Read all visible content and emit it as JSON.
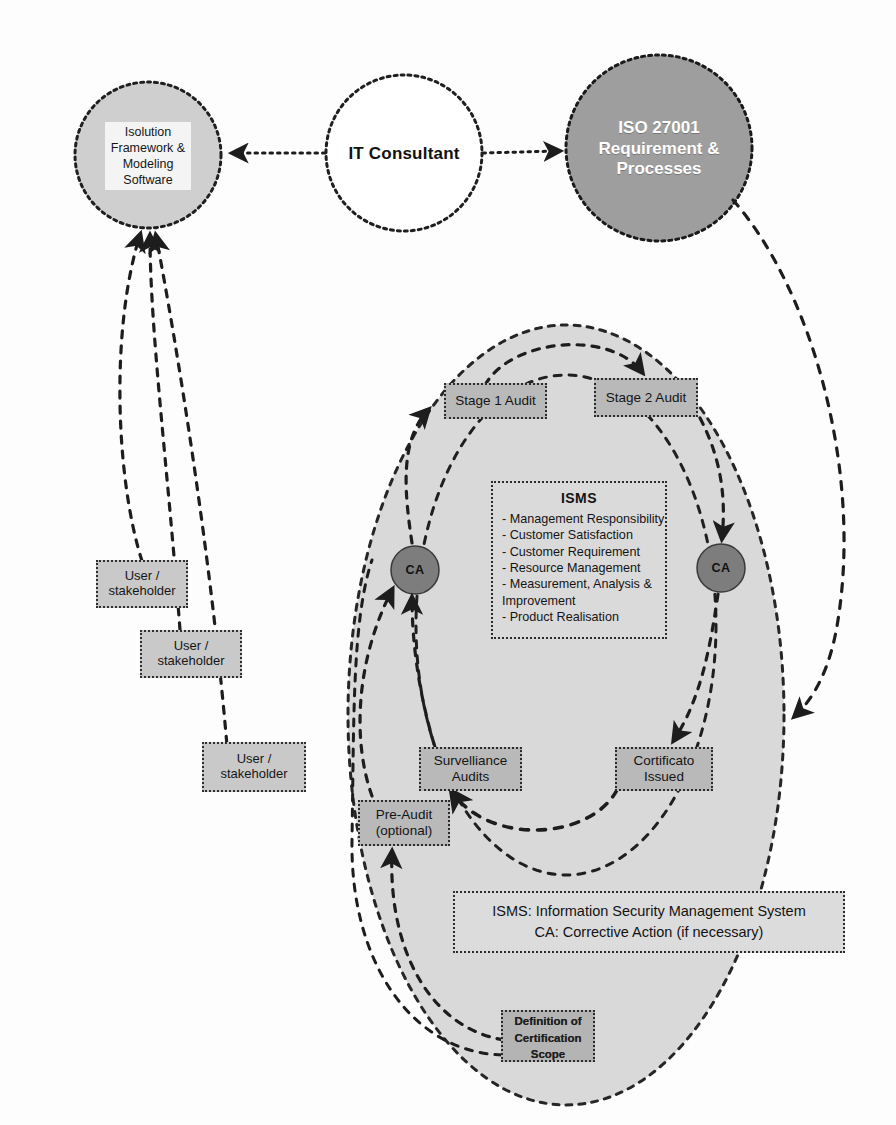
{
  "diagram": {
    "colors": {
      "ellipse_fill": "#d9d9d9",
      "box_fill": "#b9b9b9",
      "dark_circle_fill": "#9a9a9a",
      "ca_circle_fill": "#7d7d7d",
      "light_circle_fill": "#cfcfcf",
      "stroke": "#222222",
      "panel_fill": "#dadada"
    },
    "top_row": {
      "left_circle": {
        "label": "Isolution\nFramework &\nModeling\nSoftware",
        "lines": [
          "Isolution",
          "Framework &",
          "Modeling",
          "Software"
        ]
      },
      "center_circle": {
        "label": "IT Consultant"
      },
      "right_circle": {
        "lines": [
          "ISO 27001",
          "Requirement &",
          "Processes"
        ]
      }
    },
    "stakeholders": [
      {
        "lines": [
          "User /",
          "stakeholder"
        ]
      },
      {
        "lines": [
          "User /",
          "stakeholder"
        ]
      },
      {
        "lines": [
          "User /",
          "stakeholder"
        ]
      }
    ],
    "process_boxes": {
      "stage1": {
        "label": "Stage 1 Audit"
      },
      "stage2": {
        "label": "Stage 2 Audit"
      },
      "surveillance": {
        "lines": [
          "Survelliance",
          "Audits"
        ]
      },
      "certificate": {
        "lines": [
          "Cortificato",
          "Issued"
        ]
      },
      "preaudit": {
        "lines": [
          "Pre-Audit",
          "(optional)"
        ]
      },
      "scope": {
        "lines": [
          "Definition of",
          "Certification",
          "Scope"
        ]
      }
    },
    "ca_nodes": [
      {
        "label": "CA"
      },
      {
        "label": "CA"
      }
    ],
    "isms_panel": {
      "title": "ISMS",
      "items": [
        "- Management Responsibility",
        "- Customer Satisfaction",
        "- Customer Requirement",
        "- Resource Management",
        "- Measurement, Analysis &",
        "  Improvement",
        "- Product Realisation"
      ]
    },
    "legend": {
      "line1": "ISMS: Information Security Management System",
      "line2": "CA: Corrective Action (if necessary)"
    }
  }
}
